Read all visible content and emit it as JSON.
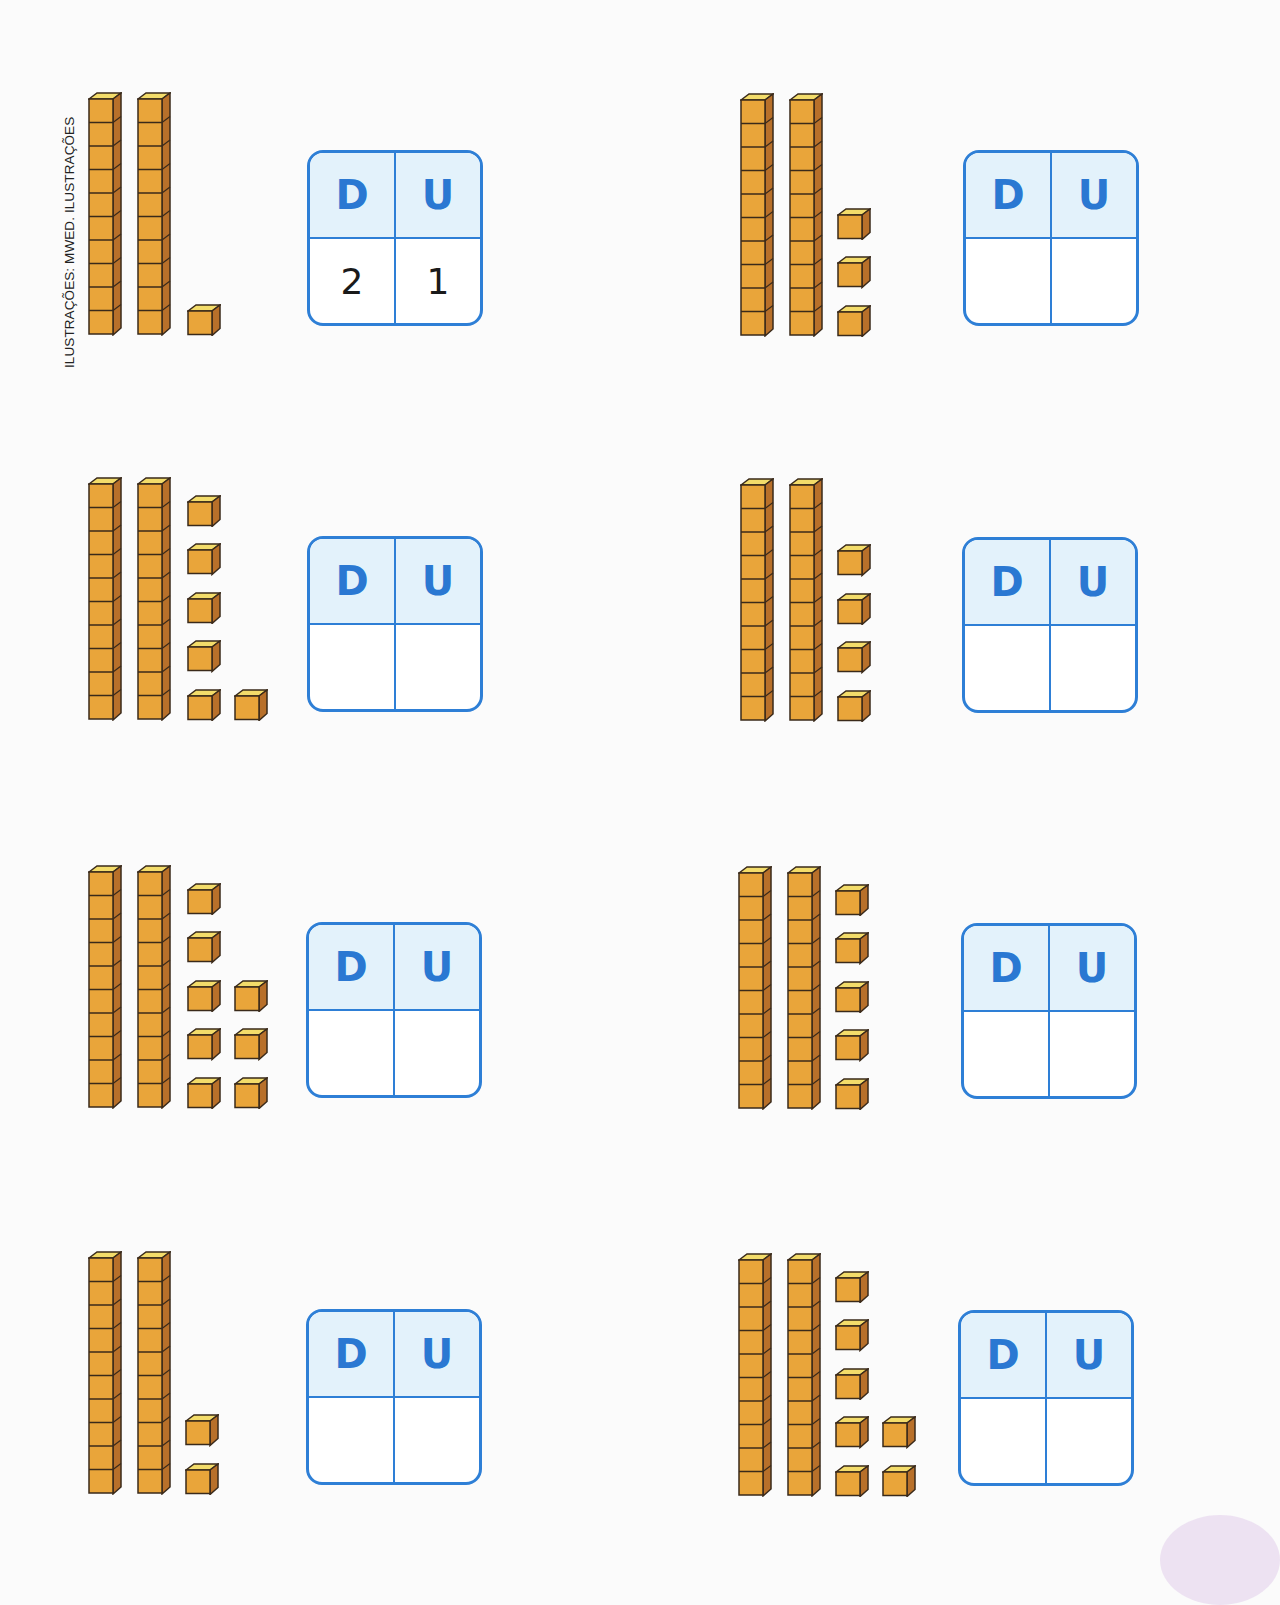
{
  "credit": "ILUSTRAÇÕES: MWED. ILUSTRAÇÕES",
  "colors": {
    "cube_front": "#e9a53a",
    "cube_side": "#b8702a",
    "cube_top": "#f3dc6a",
    "cube_outline": "#3a2a1a",
    "box_border": "#2e7fd6",
    "box_header_bg": "#e3f2fb",
    "header_letter": "#2a78d2"
  },
  "table_headers": {
    "tens": "D",
    "units": "U"
  },
  "exercises": [
    {
      "id": 1,
      "rods": 2,
      "units": 1,
      "unit_layout": [
        [
          1
        ]
      ],
      "answer_tens": "2",
      "answer_units": "1"
    },
    {
      "id": 2,
      "rods": 2,
      "units": 3,
      "unit_layout": [
        [
          3
        ]
      ],
      "answer_tens": "",
      "answer_units": ""
    },
    {
      "id": 3,
      "rods": 2,
      "units": 6,
      "unit_layout": [
        [
          5
        ],
        [
          1
        ]
      ],
      "answer_tens": "",
      "answer_units": ""
    },
    {
      "id": 4,
      "rods": 2,
      "units": 4,
      "unit_layout": [
        [
          4
        ]
      ],
      "answer_tens": "",
      "answer_units": ""
    },
    {
      "id": 5,
      "rods": 2,
      "units": 8,
      "unit_layout": [
        [
          5
        ],
        [
          3
        ]
      ],
      "answer_tens": "",
      "answer_units": ""
    },
    {
      "id": 6,
      "rods": 2,
      "units": 5,
      "unit_layout": [
        [
          5
        ]
      ],
      "answer_tens": "",
      "answer_units": ""
    },
    {
      "id": 7,
      "rods": 2,
      "units": 2,
      "unit_layout": [
        [
          2
        ]
      ],
      "answer_tens": "",
      "answer_units": ""
    },
    {
      "id": 8,
      "rods": 2,
      "units": 7,
      "unit_layout": [
        [
          5
        ],
        [
          2
        ]
      ],
      "answer_tens": "",
      "answer_units": ""
    }
  ]
}
